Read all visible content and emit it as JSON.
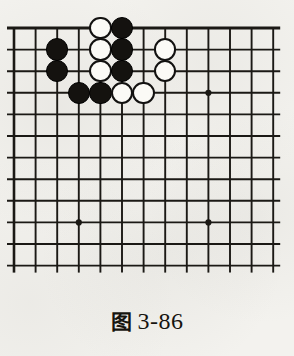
{
  "figure": {
    "caption_cn": "图",
    "caption_number": "3-86",
    "caption_full": "图 3-86"
  },
  "board": {
    "type": "go-board",
    "description": "Partial go board showing upper-left corner region",
    "columns": 13,
    "rows": 12,
    "origin_x": 14,
    "origin_y": 28,
    "cell": 21.6,
    "line_color": "#1b1915",
    "board_color": "#f3f2ee",
    "grid_overhang": 7,
    "star_points": [
      {
        "col": 3,
        "row": 9
      },
      {
        "col": 9,
        "row": 9
      },
      {
        "col": 9,
        "row": 3
      }
    ],
    "star_radius": 3.1,
    "stone_radius": 11.2,
    "stones": [
      {
        "color": "white",
        "col": 4,
        "row": 0
      },
      {
        "color": "black",
        "col": 5,
        "row": 0
      },
      {
        "color": "black",
        "col": 2,
        "row": 1
      },
      {
        "color": "white",
        "col": 4,
        "row": 1
      },
      {
        "color": "black",
        "col": 5,
        "row": 1
      },
      {
        "color": "white",
        "col": 7,
        "row": 1
      },
      {
        "color": "black",
        "col": 2,
        "row": 2
      },
      {
        "color": "white",
        "col": 4,
        "row": 2
      },
      {
        "color": "black",
        "col": 5,
        "row": 2
      },
      {
        "color": "white",
        "col": 7,
        "row": 2
      },
      {
        "color": "black",
        "col": 3,
        "row": 3
      },
      {
        "color": "black",
        "col": 4,
        "row": 3
      },
      {
        "color": "white",
        "col": 5,
        "row": 3
      },
      {
        "color": "white",
        "col": 6,
        "row": 3
      }
    ],
    "stone_colors": {
      "black_fill": "#14120f",
      "white_fill": "#fbfaf6",
      "white_border": "#121110"
    }
  }
}
